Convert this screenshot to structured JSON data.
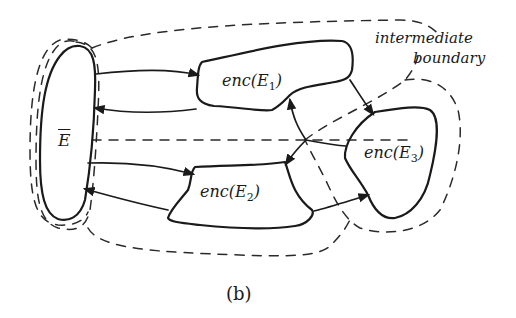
{
  "figure": {
    "caption": "(b)",
    "nodes": [
      {
        "id": "E_bar",
        "label": "E",
        "overline": true
      },
      {
        "id": "enc_E1",
        "label_prefix": "enc(",
        "label_var": "E",
        "label_sub": "1",
        "label_suffix": ")"
      },
      {
        "id": "enc_E2",
        "label_prefix": "enc(",
        "label_var": "E",
        "label_sub": "2",
        "label_suffix": ")"
      },
      {
        "id": "enc_E3",
        "label_prefix": "enc(",
        "label_var": "E",
        "label_sub": "3",
        "label_suffix": ")"
      }
    ],
    "annotation": {
      "line1": "intermediate",
      "line2": "boundary"
    },
    "edges": [
      {
        "from": "E_bar",
        "to": "enc_E1"
      },
      {
        "from": "enc_E1",
        "to": "E_bar"
      },
      {
        "from": "E_bar",
        "to": "enc_E2"
      },
      {
        "from": "enc_E2",
        "to": "E_bar"
      },
      {
        "from": "enc_E1",
        "to": "enc_E3"
      },
      {
        "from": "enc_E3",
        "to": "enc_E1"
      },
      {
        "from": "enc_E3",
        "to": "enc_E2"
      },
      {
        "from": "enc_E2",
        "to": "enc_E3"
      }
    ]
  }
}
